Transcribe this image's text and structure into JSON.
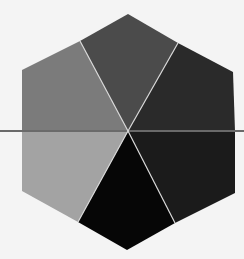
{
  "diagram": {
    "type": "hexagon-partition",
    "regions": [
      {
        "name": "upper-left-region",
        "color": "#7b7b7b"
      },
      {
        "name": "top-region",
        "color": "#4b4b4b"
      },
      {
        "name": "upper-right-region",
        "color": "#2a2a2a"
      },
      {
        "name": "lower-right-region",
        "color": "#1b1b1b"
      },
      {
        "name": "bottom-region",
        "color": "#060606"
      },
      {
        "name": "lower-left-region",
        "color": "#a3a3a3"
      }
    ],
    "divider_color": "#d8d8d8",
    "axis_line_color": "#6a6a6a",
    "background": "#f4f4f4"
  }
}
